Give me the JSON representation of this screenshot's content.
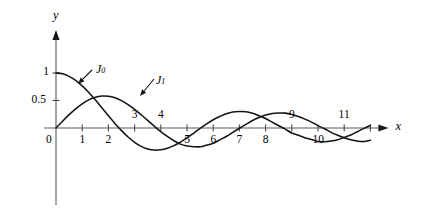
{
  "chart_data": {
    "type": "line",
    "title": "",
    "subtitle": "",
    "xlabel": "x",
    "ylabel": "y",
    "xlim": [
      -0.4,
      12.4
    ],
    "ylim": [
      -0.75,
      1.35
    ],
    "grid": false,
    "legend_position": "inline-annotations",
    "x_ticks": [
      {
        "value": 0,
        "label": "0",
        "side": "below"
      },
      {
        "value": 1,
        "label": "1",
        "side": "below"
      },
      {
        "value": 2,
        "label": "2",
        "side": "below"
      },
      {
        "value": 3,
        "label": "3",
        "side": "above"
      },
      {
        "value": 4,
        "label": "4",
        "side": "above"
      },
      {
        "value": 5,
        "label": "5",
        "side": "below"
      },
      {
        "value": 6,
        "label": "6",
        "side": "below"
      },
      {
        "value": 7,
        "label": "7",
        "side": "below"
      },
      {
        "value": 8,
        "label": "8",
        "side": "below"
      },
      {
        "value": 9,
        "label": "9",
        "side": "above"
      },
      {
        "value": 10,
        "label": "10",
        "side": "below"
      },
      {
        "value": 11,
        "label": "11",
        "side": "above"
      },
      {
        "value": 12,
        "label": "",
        "side": "none"
      }
    ],
    "y_ticks": [
      {
        "value": 0.5,
        "label": "0.5"
      },
      {
        "value": 1.0,
        "label": "1"
      }
    ],
    "x": [
      0,
      0.25,
      0.5,
      0.75,
      1,
      1.25,
      1.5,
      1.75,
      2,
      2.25,
      2.5,
      2.75,
      3,
      3.25,
      3.5,
      3.75,
      4,
      4.25,
      4.5,
      4.75,
      5,
      5.25,
      5.5,
      5.75,
      6,
      6.25,
      6.5,
      6.75,
      7,
      7.25,
      7.5,
      7.75,
      8,
      8.25,
      8.5,
      8.75,
      9,
      9.25,
      9.5,
      9.75,
      10,
      10.25,
      10.5,
      10.75,
      11,
      11.25,
      11.5,
      11.75,
      12
    ],
    "series": [
      {
        "name": "J0",
        "label": "J",
        "subscript": "0",
        "color": "#141414",
        "values": [
          1.0,
          0.9844,
          0.9385,
          0.8642,
          0.7652,
          0.6459,
          0.5118,
          0.369,
          0.2239,
          0.0827,
          -0.0484,
          -0.1641,
          -0.2601,
          -0.3332,
          -0.3801,
          -0.4018,
          -0.3971,
          -0.3687,
          -0.3205,
          -0.2566,
          -0.1776,
          -0.0968,
          -0.0068,
          0.076,
          0.1506,
          0.2095,
          0.2601,
          0.2921,
          0.3001,
          0.2951,
          0.2663,
          0.2218,
          0.1717,
          0.1065,
          0.0419,
          -0.0207,
          -0.0903,
          -0.1335,
          -0.1768,
          -0.2097,
          -0.2459,
          -0.249,
          -0.2366,
          -0.2134,
          -0.1712,
          -0.1272,
          -0.0677,
          -0.0068,
          0.0477
        ]
      },
      {
        "name": "J1",
        "label": "J",
        "subscript": "1",
        "color": "#141414",
        "values": [
          0.0,
          0.124,
          0.2423,
          0.3492,
          0.4401,
          0.5106,
          0.5579,
          0.5802,
          0.5767,
          0.5484,
          0.4971,
          0.4258,
          0.3391,
          0.2404,
          0.1374,
          0.0333,
          -0.066,
          -0.1538,
          -0.2311,
          -0.2935,
          -0.3276,
          -0.3395,
          -0.3414,
          -0.311,
          -0.2767,
          -0.2159,
          -0.1538,
          -0.0787,
          -0.0047,
          0.0668,
          0.1352,
          0.1896,
          0.2346,
          0.2635,
          0.2731,
          0.2701,
          0.2453,
          0.2089,
          0.1613,
          0.1072,
          0.0435,
          -0.0127,
          -0.0789,
          -0.1312,
          -0.1768,
          -0.214,
          -0.2381,
          -0.2472,
          -0.2234
        ]
      }
    ],
    "annotations": [
      {
        "name": "J0-callout",
        "text": "J",
        "subscript": "0",
        "label_x": 96,
        "label_y": 62,
        "arrow_from_x": 92,
        "arrow_from_y": 70,
        "arrow_to_x": 78,
        "arrow_to_y": 84
      },
      {
        "name": "J1-callout",
        "text": "J",
        "subscript": "1",
        "label_x": 156,
        "label_y": 73,
        "arrow_from_x": 154,
        "arrow_from_y": 79,
        "arrow_to_x": 140,
        "arrow_to_y": 96
      }
    ]
  },
  "axes": {
    "x_axis_name": "x",
    "y_axis_name": "y"
  }
}
